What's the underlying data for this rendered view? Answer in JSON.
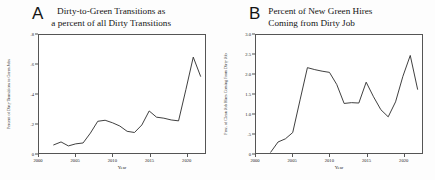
{
  "figure": {
    "background": "#fdfdfd",
    "line_color": "#2a2a2a",
    "axis_color": "#555555"
  },
  "panels": [
    {
      "letter": "A",
      "title": "Dirty-to-Green Transitions as\na percent of all Dirty Transitions"
    },
    {
      "letter": "B",
      "title": "Percent of New Green Hires\nComing from Dirty Job"
    }
  ],
  "chart_data": [
    {
      "type": "line",
      "title": "Dirty-to-Green Transitions as a percent of all Dirty Transitions",
      "panel_letter": "A",
      "xlabel": "Year",
      "ylabel": "Percent of Dirty Transitions to Green Jobs",
      "xlim": [
        2000,
        2022.6
      ],
      "ylim": [
        0,
        0.8
      ],
      "xticks": [
        2000,
        2005,
        2010,
        2015,
        2020
      ],
      "xticklabels": [
        "2000",
        "2005",
        "2010",
        "2015",
        "2020"
      ],
      "yticks": [
        0,
        0.2,
        0.4,
        0.6,
        0.8
      ],
      "yticklabels": [
        "0",
        ".2",
        ".4",
        ".6",
        ".8"
      ],
      "grid": false,
      "legend": null,
      "x": [
        2002,
        2003,
        2004,
        2005,
        2006,
        2007,
        2008,
        2009,
        2010,
        2011,
        2012,
        2013,
        2014,
        2015,
        2016,
        2017,
        2018,
        2019,
        2020,
        2021,
        2022
      ],
      "values": [
        0.055,
        0.075,
        0.048,
        0.062,
        0.068,
        0.135,
        0.215,
        0.222,
        0.205,
        0.183,
        0.147,
        0.139,
        0.19,
        0.285,
        0.243,
        0.236,
        0.224,
        0.218,
        0.43,
        0.65,
        0.52
      ]
    },
    {
      "type": "line",
      "title": "Percent of New Green Hires Coming from Dirty Job",
      "panel_letter": "B",
      "xlabel": "Year",
      "ylabel": "Perc. of Clean Job Hires Coming From Dirty Job",
      "xlim": [
        2000,
        2022.6
      ],
      "ylim": [
        0,
        3.0
      ],
      "xticks": [
        2000,
        2005,
        2010,
        2015,
        2020
      ],
      "xticklabels": [
        "2000",
        "2005",
        "2010",
        "2015",
        "2020"
      ],
      "yticks": [
        0,
        0.5,
        1.0,
        1.5,
        2.0,
        2.5,
        3.0
      ],
      "yticklabels": [
        "0",
        ".5",
        "1.0",
        "1.5",
        "2.0",
        "2.5",
        "3.0"
      ],
      "grid": false,
      "legend": null,
      "x": [
        2002,
        2003,
        2004,
        2005,
        2006,
        2007,
        2008,
        2009,
        2010,
        2011,
        2012,
        2013,
        2014,
        2015,
        2016,
        2017,
        2018,
        2019,
        2020,
        2021,
        2022
      ],
      "values": [
        0.02,
        0.28,
        0.36,
        0.52,
        1.35,
        2.17,
        2.12,
        2.08,
        2.05,
        1.74,
        1.26,
        1.28,
        1.27,
        1.8,
        1.43,
        1.1,
        0.92,
        1.3,
        1.95,
        2.48,
        1.62
      ]
    }
  ]
}
